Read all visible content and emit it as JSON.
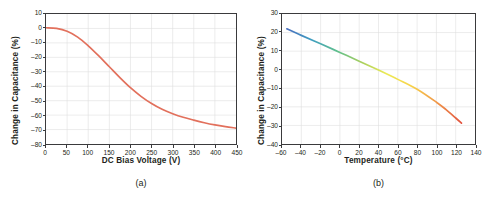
{
  "figure": {
    "panels": [
      {
        "id": "a",
        "caption": "(a)",
        "chart_data": {
          "type": "line",
          "title": "",
          "xlabel": "DC Bias Voltage (V)",
          "ylabel": "Change in Capacitance (%)",
          "xlim": [
            0,
            450
          ],
          "ylim": [
            -80,
            10
          ],
          "xticks": [
            0,
            50,
            100,
            150,
            200,
            250,
            300,
            350,
            400,
            450
          ],
          "yticks": [
            10,
            0,
            -10,
            -20,
            -30,
            -40,
            -50,
            -60,
            -70,
            -80
          ],
          "grid": true,
          "legend": "none",
          "series": [
            {
              "name": "Capacitance vs DC bias",
              "color": "#e2705c",
              "x": [
                0,
                25,
                50,
                75,
                100,
                125,
                150,
                175,
                200,
                225,
                250,
                275,
                300,
                325,
                350,
                375,
                400,
                425,
                450
              ],
              "y": [
                0.5,
                0.0,
                -2.0,
                -6.0,
                -12.0,
                -19.0,
                -26.5,
                -34.0,
                -41.0,
                -47.0,
                -52.0,
                -56.0,
                -59.0,
                -61.5,
                -63.5,
                -65.3,
                -66.8,
                -68.0,
                -69.0
              ]
            }
          ]
        }
      },
      {
        "id": "b",
        "caption": "(b)",
        "chart_data": {
          "type": "line",
          "title": "",
          "xlabel": "Temperature (°C)",
          "ylabel": "Change in Capacitance (%)",
          "xlim": [
            -60,
            140
          ],
          "ylim": [
            -40,
            30
          ],
          "xticks": [
            -60,
            -40,
            -20,
            0,
            20,
            40,
            60,
            80,
            100,
            120,
            140
          ],
          "yticks": [
            30,
            20,
            10,
            0,
            -10,
            -20,
            -30,
            -40
          ],
          "grid": true,
          "legend": "none",
          "series": [
            {
              "name": "Capacitance vs temperature",
              "gradient": [
                "#4a6fbf",
                "#3f9ec0",
                "#5fbf8e",
                "#a8cf5e",
                "#ecea55",
                "#f7d24a",
                "#f0984a",
                "#e2533f"
              ],
              "x": [
                -55,
                -40,
                -20,
                0,
                20,
                40,
                60,
                80,
                100,
                110,
                120,
                126
              ],
              "y": [
                22.0,
                18.5,
                14.0,
                9.3,
                4.6,
                -0.2,
                -5.2,
                -10.5,
                -17.5,
                -21.5,
                -26.0,
                -28.8
              ]
            }
          ]
        }
      }
    ]
  }
}
